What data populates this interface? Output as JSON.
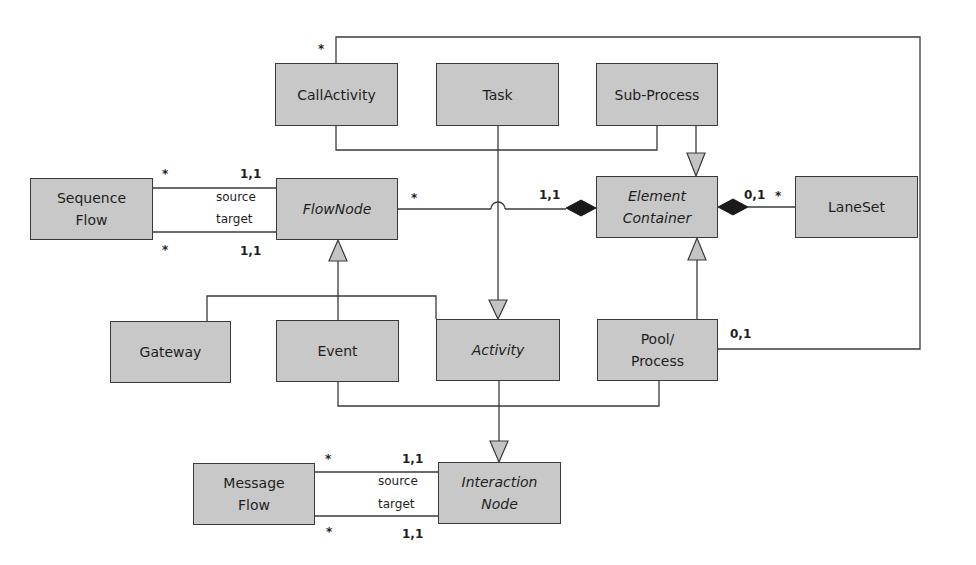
{
  "diagram": {
    "type": "UML class diagram (BPMN metamodel excerpt)",
    "classes": {
      "call_activity": {
        "label": "CallActivity",
        "abstract": false
      },
      "task": {
        "label": "Task",
        "abstract": false
      },
      "sub_process": {
        "label": "Sub-Process",
        "abstract": false
      },
      "sequence_flow": {
        "label": "Sequence\nFlow",
        "abstract": false
      },
      "flow_node": {
        "label": "FlowNode",
        "abstract": true
      },
      "element_container": {
        "label": "Element\nContainer",
        "abstract": true
      },
      "lane_set": {
        "label": "LaneSet",
        "abstract": false
      },
      "gateway": {
        "label": "Gateway",
        "abstract": false
      },
      "event": {
        "label": "Event",
        "abstract": false
      },
      "activity": {
        "label": "Activity",
        "abstract": true
      },
      "pool_process": {
        "label": "Pool/\nProcess",
        "abstract": false
      },
      "message_flow": {
        "label": "Message\nFlow",
        "abstract": false
      },
      "interaction_node": {
        "label": "Interaction\nNode",
        "abstract": true
      }
    },
    "labels": {
      "seq_src_mult_left": "*",
      "seq_src_mult_right": "1,1",
      "seq_src_role": "source",
      "seq_tgt_role": "target",
      "seq_tgt_mult_left": "*",
      "seq_tgt_mult_right": "1,1",
      "flownode_container_mult_left": "*",
      "flownode_container_mult_right": "1,1",
      "container_laneset_mult_left": "0,1",
      "container_laneset_mult_right": "*",
      "callactivity_mult": "*",
      "pool_mult": "0,1",
      "msg_src_mult_left": "*",
      "msg_src_mult_right": "1,1",
      "msg_src_role": "source",
      "msg_tgt_role": "target",
      "msg_tgt_mult_left": "*",
      "msg_tgt_mult_right": "1,1"
    },
    "relationships": [
      {
        "kind": "generalization",
        "from": [
          "CallActivity",
          "Sub-Process"
        ],
        "to": "Element Container"
      },
      {
        "kind": "generalization",
        "from": [
          "CallActivity",
          "Task",
          "Sub-Process"
        ],
        "to": "Activity"
      },
      {
        "kind": "generalization",
        "from": [
          "Gateway",
          "Event",
          "Activity"
        ],
        "to": "FlowNode"
      },
      {
        "kind": "generalization",
        "from": [
          "Pool/Process"
        ],
        "to": "Element Container"
      },
      {
        "kind": "generalization",
        "from": [
          "Event",
          "Activity",
          "Pool/Process"
        ],
        "to": "Interaction Node"
      },
      {
        "kind": "composition",
        "whole": "Element Container",
        "part": "FlowNode",
        "mult_whole": "1,1",
        "mult_part": "*"
      },
      {
        "kind": "composition",
        "whole": "Element Container",
        "part": "LaneSet",
        "mult_whole": "0,1",
        "mult_part": "*"
      },
      {
        "kind": "association",
        "a": "Sequence Flow",
        "b": "FlowNode",
        "role": "source",
        "mult_a": "*",
        "mult_b": "1,1"
      },
      {
        "kind": "association",
        "a": "Sequence Flow",
        "b": "FlowNode",
        "role": "target",
        "mult_a": "*",
        "mult_b": "1,1"
      },
      {
        "kind": "association",
        "a": "CallActivity",
        "b": "Pool/Process",
        "mult_a": "*",
        "mult_b": "0,1"
      },
      {
        "kind": "association",
        "a": "Message Flow",
        "b": "Interaction Node",
        "role": "source",
        "mult_a": "*",
        "mult_b": "1,1"
      },
      {
        "kind": "association",
        "a": "Message Flow",
        "b": "Interaction Node",
        "role": "target",
        "mult_a": "*",
        "mult_b": "1,1"
      }
    ],
    "colors": {
      "box_fill": "#c8c8c8",
      "line": "#3a3a3a",
      "background": "#ffffff"
    }
  }
}
